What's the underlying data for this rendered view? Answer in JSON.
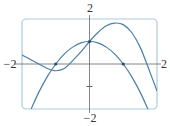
{
  "chart_data": {
    "type": "line",
    "title": "",
    "xlabel": "",
    "ylabel": "",
    "xlim": [
      -2,
      2
    ],
    "ylim": [
      -2,
      2
    ],
    "grid": false,
    "tick_labels": {
      "x_left": "−2",
      "x_right": "2",
      "y_top": "2",
      "y_bottom": "−2"
    },
    "minor_ticks": {
      "y": [
        -1
      ]
    },
    "series": [
      {
        "name": "parabola",
        "x": [
          -1.73,
          -1.5,
          -1.25,
          -1.0,
          -0.75,
          -0.5,
          -0.25,
          0.0,
          0.25,
          0.5,
          0.75,
          1.0,
          1.25,
          1.5,
          1.73
        ],
        "y": [
          -2.0,
          -1.25,
          -0.56,
          0.0,
          0.44,
          0.75,
          0.94,
          1.0,
          0.94,
          0.75,
          0.44,
          0.0,
          -0.56,
          -1.25,
          -2.0
        ]
      },
      {
        "name": "wave-curve",
        "x": [
          -2.0,
          -1.75,
          -1.5,
          -1.25,
          -1.0,
          -0.75,
          -0.5,
          -0.25,
          0.0,
          0.25,
          0.5,
          0.75,
          1.0,
          1.25,
          1.5,
          1.75,
          2.0
        ],
        "y": [
          0.4,
          0.2,
          0.0,
          -0.2,
          -0.3,
          -0.2,
          0.15,
          0.55,
          1.0,
          1.4,
          1.7,
          1.82,
          1.75,
          1.4,
          0.75,
          -0.2,
          -1.2
        ]
      }
    ],
    "marked_points": [
      {
        "x": -1.0,
        "y": 0.0
      },
      {
        "x": 0.0,
        "y": 1.0
      },
      {
        "x": 1.0,
        "y": 0.0
      }
    ],
    "colors": {
      "curve": "#4a7fa8",
      "frame": "#a9cbe0",
      "axis": "#666666"
    }
  }
}
